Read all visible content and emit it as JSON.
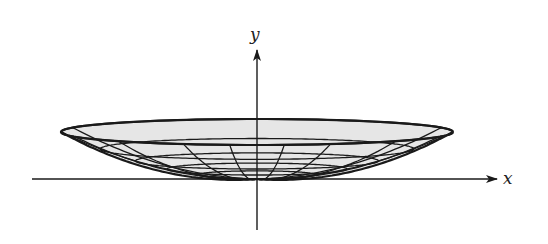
{
  "figure": {
    "axes": {
      "x_label": "x",
      "y_label": "y"
    },
    "colors": {
      "surface_fill": "#e6e6e6",
      "lines": "#1a1a1a",
      "background": "#ffffff"
    },
    "geometry": {
      "origin": [
        257,
        179
      ],
      "rim_half_width": 196,
      "rim_height": 47,
      "rim_tilt": 13,
      "level_fractions": [
        1.0,
        0.8,
        0.62,
        0.46,
        0.3
      ],
      "meridian_angles_deg": [
        0,
        22,
        45,
        68,
        82,
        98,
        112,
        135,
        158,
        180,
        200,
        340
      ]
    }
  }
}
